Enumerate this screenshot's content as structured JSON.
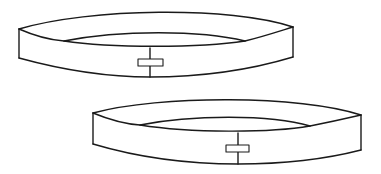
{
  "figure": {
    "stroke_color": "#1a1a1a",
    "background_color": "#ffffff",
    "bands": [
      {
        "name": "band-top",
        "left_edge": {
          "x": 19,
          "top": 29,
          "bottom": 58
        },
        "right_edge": {
          "x": 293,
          "top": 27,
          "bottom": 57
        },
        "inner_left_x": 64,
        "inner_right_x": 245,
        "seam_x": 150,
        "tape": {
          "x": 138,
          "y": 59,
          "w": 25,
          "h": 7
        }
      },
      {
        "name": "band-bottom",
        "left_edge": {
          "x": 93,
          "top": 113,
          "bottom": 144
        },
        "right_edge": {
          "x": 361,
          "top": 115,
          "bottom": 150
        },
        "inner_left_x": 140,
        "inner_right_x": 310,
        "seam_x": 238,
        "tape": {
          "x": 226,
          "y": 145,
          "w": 23,
          "h": 7
        }
      }
    ]
  }
}
